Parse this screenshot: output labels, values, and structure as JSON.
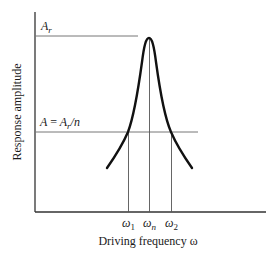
{
  "diagram": {
    "type": "resonance-curve",
    "y_axis_label": "Response amplitude",
    "x_axis_label": "Driving frequency ω",
    "level_labels": {
      "peak": "Ar",
      "threshold": "A = Ar/n"
    },
    "frequency_markers": [
      {
        "label": "ω1",
        "base": "ω",
        "sub": "1"
      },
      {
        "label": "ωn",
        "base": "ω",
        "sub": "n"
      },
      {
        "label": "ω2",
        "base": "ω",
        "sub": "2"
      }
    ],
    "colors": {
      "curve": "#111111",
      "axes": "#333333",
      "guides": "#777777",
      "background": "#ffffff"
    }
  }
}
